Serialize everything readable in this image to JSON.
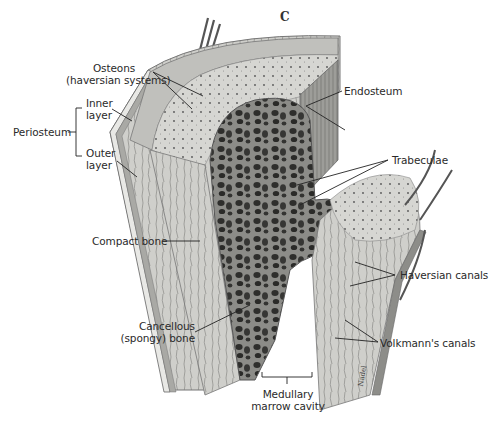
{
  "figure": {
    "panel_letter": "C",
    "artist_signature": "Nadel"
  },
  "labels": {
    "osteons_line1": "Osteons",
    "osteons_line2": "(haversian systems)",
    "inner_layer_line1": "Inner",
    "inner_layer_line2": "layer",
    "periosteum": "Periosteum",
    "outer_layer_line1": "Outer",
    "outer_layer_line2": "layer",
    "endosteum": "Endosteum",
    "trabeculae": "Trabeculae",
    "compact_bone": "Compact bone",
    "haversian_canals": "Haversian canals",
    "cancellous_line1": "Cancellous",
    "cancellous_line2": "(spongy) bone",
    "volkmanns_canals": "Volkmann's canals",
    "medullary_line1": "Medullary",
    "medullary_line2": "marrow cavity"
  },
  "colors": {
    "background": "#ffffff",
    "bone_light": "#d9d9d6",
    "bone_mid": "#b5b5b1",
    "bone_dark": "#6e6e6b",
    "spongy_dark": "#3a3a38",
    "leader_line": "#222222"
  }
}
